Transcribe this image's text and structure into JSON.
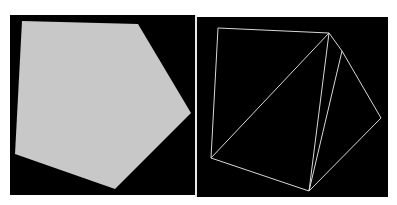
{
  "figure": {
    "background": "#ffffff",
    "panels": [
      {
        "id": "left",
        "description": "filled pentagon",
        "background": "#000000",
        "fill": "#c8c8c8",
        "vertices": [
          [
            22,
            21
          ],
          [
            138,
            24
          ],
          [
            191,
            113
          ],
          [
            115,
            189
          ],
          [
            15,
            154
          ]
        ]
      },
      {
        "id": "right",
        "description": "triangulated wireframe pentagon",
        "background": "#000000",
        "stroke": "#d8d8d8",
        "vertices": {
          "A": [
            218,
            28
          ],
          "B": [
            329,
            33
          ],
          "C": [
            342,
            51
          ],
          "D": [
            381,
            118
          ],
          "E": [
            309,
            191
          ],
          "F": [
            211,
            158
          ]
        },
        "edges": [
          [
            "A",
            "B"
          ],
          [
            "A",
            "F"
          ],
          [
            "B",
            "F"
          ],
          [
            "B",
            "E"
          ],
          [
            "B",
            "C"
          ],
          [
            "C",
            "D"
          ],
          [
            "C",
            "E"
          ],
          [
            "D",
            "E"
          ],
          [
            "F",
            "E"
          ]
        ]
      }
    ]
  }
}
